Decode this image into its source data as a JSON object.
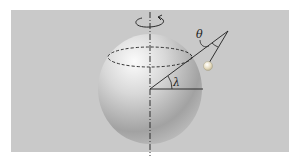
{
  "diagram": {
    "labels": {
      "latitude": "λ",
      "angle": "θ"
    },
    "colors": {
      "background": "#ffffff",
      "panel": "#c9c9c9",
      "sphere_light": "#f4f4f4",
      "sphere_dark": "#8e8e8e",
      "lines": "#1e1e1e",
      "bob": "#e8e2c8"
    },
    "elements": [
      "rotation-axis",
      "rotation-arrow",
      "earth-spheroid",
      "latitude-circle",
      "radius-line",
      "equatorial-line",
      "latitude-angle-arc",
      "pendulum-string",
      "pendulum-bob",
      "theta-angle-arc"
    ]
  }
}
